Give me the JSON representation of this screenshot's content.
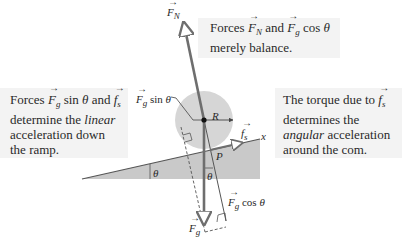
{
  "callouts": {
    "top": {
      "line1": {
        "pre": "Forces ",
        "v1": "F",
        "v1sub": "N",
        "mid": " and ",
        "v2": "F",
        "v2sub": "g",
        "post": " cos ",
        "theta": "θ"
      },
      "line2": "merely balance."
    },
    "left": {
      "line1": {
        "pre": "Forces ",
        "v1": "F",
        "v1sub": "g",
        "mid": " sin ",
        "theta": "θ",
        "and": " and ",
        "v2": "f",
        "v2sub": "s"
      },
      "line2": {
        "pre": "determine the ",
        "em": "linear"
      },
      "line3": "acceleration down",
      "line4": "the ramp."
    },
    "right": {
      "line1": {
        "pre": "The torque due to ",
        "v": "f",
        "vsub": "s"
      },
      "line2": "determines the",
      "line3": {
        "em": "angular",
        "post": " acceleration"
      },
      "line4": "around the com."
    }
  },
  "labels": {
    "FN": {
      "v": "F",
      "sub": "N"
    },
    "Fg": {
      "v": "F",
      "sub": "g"
    },
    "Fgsin": {
      "v": "F",
      "sub": "g",
      "text": " sin ",
      "theta": "θ"
    },
    "Fgcos": {
      "v": "F",
      "sub": "g",
      "text": " cos ",
      "theta": "θ"
    },
    "fs": {
      "v": "f",
      "sub": "s"
    },
    "R": "R",
    "P": "P",
    "x": "x",
    "theta_ramp": "θ",
    "theta_vertical": "θ"
  },
  "colors": {
    "callout_bg": "#f3f3f3",
    "circle": "#d6d6d6",
    "ramp": "#c9c9c9",
    "arrow": "#6e6e6e",
    "line": "#555555"
  }
}
